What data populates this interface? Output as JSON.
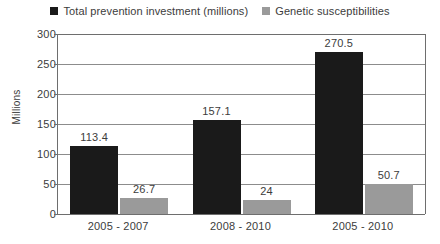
{
  "chart_data": {
    "type": "bar",
    "title": "",
    "subtitle": "",
    "xlabel": "",
    "ylabel": "Millions",
    "ylim": [
      0,
      300
    ],
    "ytick_step": 50,
    "yticks": [
      "300",
      "250",
      "200",
      "150",
      "100",
      "50",
      "0"
    ],
    "ytick_values": [
      300,
      250,
      200,
      150,
      100,
      50,
      0
    ],
    "grid": "horizontal",
    "legend_position": "top-center",
    "categories": [
      "2005 - 2007",
      "2008 - 2010",
      "2005 - 2010"
    ],
    "series": [
      {
        "name": "Total prevention investment (millions)",
        "color": "#1a1a1a",
        "values": [
          113.4,
          157.1,
          270.5
        ],
        "labels": [
          "113.4",
          "157.1",
          "270.5"
        ]
      },
      {
        "name": "Genetic susceptibilities",
        "color": "#9a9a9a",
        "values": [
          26.7,
          24,
          50.7
        ],
        "labels": [
          "26.7",
          "24",
          "50.7"
        ]
      }
    ]
  },
  "legend": {
    "entries": [
      {
        "label": "Total prevention investment (millions)",
        "swatch_color": "#1a1a1a",
        "swatch_name": "legend-swatch-black"
      },
      {
        "label": "Genetic susceptibilities",
        "swatch_color": "#9a9a9a",
        "swatch_name": "legend-swatch-gray"
      }
    ]
  },
  "axes": {
    "y_title": "Millions",
    "axis_color": "#6e6e6e",
    "gridline_color": "#8c8c8c"
  },
  "canvas": {
    "background": "#ffffff",
    "text_color": "#3c3c3c"
  }
}
